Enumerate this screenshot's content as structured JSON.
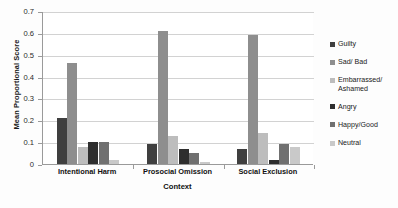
{
  "chart_data": {
    "type": "bar",
    "title": "",
    "xlabel": "Context",
    "ylabel": "Mean Proportional Score",
    "categories": [
      "Intentional Harm",
      "Prosocial Omission",
      "Social Exclusion"
    ],
    "ylim": [
      0,
      0.7
    ],
    "ytick_labels": [
      "0.7",
      "0.6",
      "0.5",
      "0.4",
      "0.3",
      "0.2",
      "0.1",
      "0"
    ],
    "ytick_values": [
      0.7,
      0.6,
      0.5,
      0.4,
      0.3,
      0.2,
      0.1,
      0
    ],
    "grid": true,
    "legend_position": "right",
    "series": [
      {
        "name": "Guilty",
        "color": "#3f3f3f",
        "values": [
          0.21,
          0.09,
          0.07
        ]
      },
      {
        "name": "Sad/ Bad",
        "color": "#8e8e8e",
        "values": [
          0.46,
          0.61,
          0.59
        ]
      },
      {
        "name": "Embarrassed/\nAshamed",
        "color": "#bdbdbd",
        "values": [
          0.08,
          0.13,
          0.14
        ]
      },
      {
        "name": "Angry",
        "color": "#2e2e2e",
        "values": [
          0.1,
          0.07,
          0.02
        ]
      },
      {
        "name": "Happy/Good",
        "color": "#707070",
        "values": [
          0.1,
          0.05,
          0.09
        ]
      },
      {
        "name": "Neutral",
        "color": "#c9c9c9",
        "values": [
          0.02,
          0.01,
          0.08
        ]
      }
    ]
  }
}
